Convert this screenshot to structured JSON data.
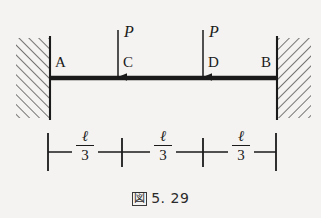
{
  "figure": {
    "caption_mark": "図",
    "caption_number": "5. 29",
    "background_color": "#f4f3f1",
    "ink_color": "#1a1a1a"
  },
  "beam": {
    "label_left_support": "A",
    "label_right_support": "B",
    "label_load_point_1": "C",
    "label_load_point_2": "D"
  },
  "loads": [
    {
      "label": "P",
      "at": "C"
    },
    {
      "label": "P",
      "at": "D"
    }
  ],
  "dimensions": [
    {
      "numerator": "ℓ",
      "denominator": "3"
    },
    {
      "numerator": "ℓ",
      "denominator": "3"
    },
    {
      "numerator": "ℓ",
      "denominator": "3"
    }
  ]
}
